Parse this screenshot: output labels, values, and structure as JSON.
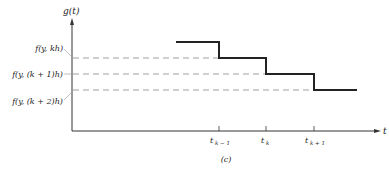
{
  "y_axis_label": "g(t)",
  "x_axis_label": "t",
  "caption": "(c)",
  "levels": [
    {
      "label": "f(y, kh)"
    },
    {
      "label": "f(y, (k + 1)h)"
    },
    {
      "label": "f(y, (k + 2)h)"
    }
  ],
  "ticks": [
    {
      "label": "t",
      "sub": "k − 1"
    },
    {
      "label": "t",
      "sub": "k"
    },
    {
      "label": "t",
      "sub": "k + 1"
    }
  ]
}
